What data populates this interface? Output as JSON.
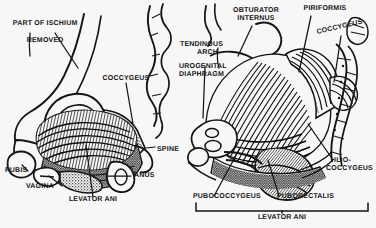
{
  "figure": {
    "type": "anatomical-line-engraving",
    "background_color": "#f7f7f8",
    "ink_color": "#151515",
    "panels": [
      {
        "id": "left",
        "view": "medial sagittal view of hemipelvis"
      },
      {
        "id": "right",
        "view": "superior / internal view of pelvic floor"
      }
    ]
  },
  "labels": {
    "part_of_ischium_removed_line1": "PART OF ISCHIUM",
    "part_of_ischium_removed_line2": "REMOVED",
    "coccygeus_left": "COCCYGEUS",
    "spine": "SPINE",
    "pubis": "PUBIS",
    "vagina": "VAGINA",
    "anus": "ANUS",
    "levator_ani_left": "LEVATOR ANI",
    "tendinous": "TENDINOUS",
    "arch": "ARCH",
    "urogenital": "UROGENITAL",
    "diaphragm": "DIAPHRAGM",
    "obturator": "OBTURATOR",
    "internus": "INTERNUS",
    "piriformis": "PIRIFORMIS",
    "coccygeus_right": "COCCYGEUS",
    "ilio": "ILIO-",
    "coccygeus_ilio": "COCCYGEUS",
    "pubococcygeus": "PUBOCOCCYGEUS",
    "puborectalis": "PUBORECTALIS",
    "levator_ani_bracket": "LEVATOR ANI"
  }
}
